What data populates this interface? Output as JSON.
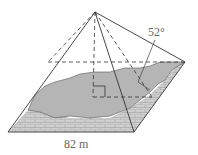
{
  "diagram": {
    "type": "pyramid",
    "base_label": "82 m",
    "angle_label": "52°",
    "colors": {
      "line": "#333333",
      "fill_shade": "#b8b8b8",
      "brick": "#c8c8c8",
      "label": "#666666"
    }
  }
}
